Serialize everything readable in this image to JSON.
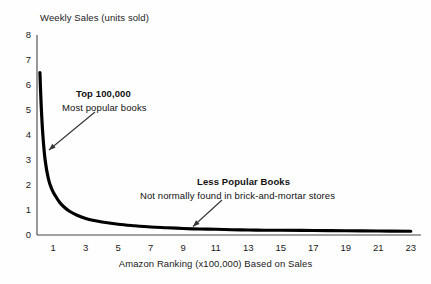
{
  "chart_data": {
    "type": "line",
    "title": "",
    "subtitle": "",
    "xlabel": "Amazon Ranking (x100,000) Based on Sales",
    "ylabel": "Weekly Sales (units sold)",
    "xlim": [
      0,
      23.5
    ],
    "ylim": [
      0,
      8
    ],
    "grid": false,
    "legend": "none",
    "xticks": [
      1,
      3,
      5,
      7,
      9,
      11,
      13,
      15,
      17,
      19,
      21,
      23
    ],
    "xtick_labels": [
      "1",
      "3",
      "5",
      "7",
      "9",
      "11",
      "13",
      "15",
      "17",
      "19",
      "21",
      "23"
    ],
    "yticks": [
      0,
      1,
      2,
      3,
      4,
      5,
      6,
      7,
      8
    ],
    "ytick_labels": [
      "0",
      "1",
      "2",
      "3",
      "4",
      "5",
      "6",
      "7",
      "8"
    ],
    "series": [
      {
        "name": "Weekly sales vs Amazon rank",
        "x": [
          0.18,
          0.25,
          0.35,
          0.5,
          0.7,
          0.9,
          1.1,
          1.4,
          1.7,
          2.0,
          2.5,
          3.0,
          3.5,
          4.0,
          5.0,
          6.0,
          7.0,
          8.0,
          9.0,
          10.0,
          11.0,
          12.0,
          13.0,
          14.0,
          15.0,
          17.0,
          19.0,
          21.0,
          23.0
        ],
        "y": [
          6.5,
          5.3,
          4.1,
          3.0,
          2.25,
          1.85,
          1.6,
          1.3,
          1.1,
          0.95,
          0.78,
          0.66,
          0.58,
          0.52,
          0.43,
          0.37,
          0.32,
          0.29,
          0.26,
          0.24,
          0.23,
          0.21,
          0.2,
          0.19,
          0.19,
          0.18,
          0.17,
          0.16,
          0.15
        ]
      }
    ],
    "annotations": [
      {
        "id": "top-100k",
        "title": "Top 100,000",
        "subtitle": "Most popular books",
        "points_to_x": 0.55,
        "points_to_y": 3.4
      },
      {
        "id": "less-popular",
        "title": "Less Popular Books",
        "subtitle": "Not normally found in brick-and-mortar stores",
        "points_to_x": 9.6,
        "points_to_y": 0.3
      }
    ],
    "colors": {
      "curve": "#000000",
      "axis": "#444444",
      "text": "#111111",
      "background": "#fefefe",
      "arrow": "#333333"
    }
  },
  "annotations": {
    "top": {
      "title": "Top 100,000",
      "subtitle": "Most popular books"
    },
    "less": {
      "title": "Less Popular Books",
      "subtitle": "Not normally found in brick-and-mortar stores"
    }
  },
  "axes": {
    "ylabel": "Weekly Sales (units sold)",
    "xlabel": "Amazon Ranking (x100,000) Based on Sales"
  }
}
